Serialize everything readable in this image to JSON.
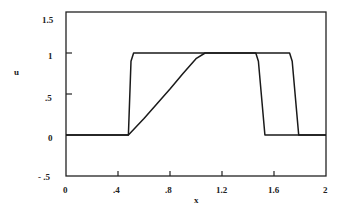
{
  "chart_data": {
    "type": "line",
    "title": "",
    "xlabel": "x",
    "ylabel": "u",
    "xlim": [
      0,
      2
    ],
    "ylim": [
      -0.5,
      1.5
    ],
    "xticks": [
      0,
      0.4,
      0.8,
      1.2,
      1.6,
      2
    ],
    "xtick_labels": [
      "0",
      ".4",
      ".8",
      "1.2",
      "1.6",
      "2"
    ],
    "yticks": [
      1.5,
      1,
      0.5,
      0,
      -0.5
    ],
    "ytick_labels": [
      "1.5",
      "1",
      ".5",
      "0",
      "- .5"
    ],
    "grid": false,
    "legend": null,
    "series": [
      {
        "name": "steep profile",
        "x": [
          0,
          0.48,
          0.5,
          0.52,
          1.46,
          1.48,
          1.53,
          2
        ],
        "y": [
          0,
          0,
          0.9,
          1,
          1,
          0.9,
          0,
          0
        ]
      },
      {
        "name": "smoothed profile",
        "x": [
          0,
          0.48,
          0.6,
          0.7,
          0.8,
          0.9,
          1.0,
          1.07,
          1.72,
          1.74,
          1.79,
          2
        ],
        "y": [
          0,
          0,
          0.2,
          0.38,
          0.56,
          0.75,
          0.93,
          1,
          1,
          0.9,
          0,
          0
        ]
      }
    ]
  },
  "axes": {
    "xlabel": "x",
    "ylabel": "u",
    "xtick_labels": [
      "0",
      ".4",
      ".8",
      "1.2",
      "1.6",
      "2"
    ],
    "ytick_labels": [
      "1.5",
      "1",
      ".5",
      "0",
      "- .5"
    ]
  }
}
